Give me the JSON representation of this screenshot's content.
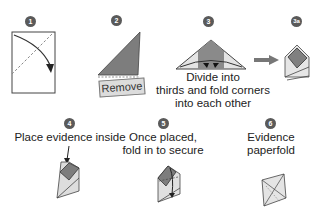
{
  "steps": [
    {
      "number": "1",
      "caption": ""
    },
    {
      "number": "2",
      "caption": "",
      "tag": "Remove"
    },
    {
      "number": "3",
      "caption_lines": [
        "Divide into",
        "thirds and fold corners",
        "into each other"
      ]
    },
    {
      "number": "3a",
      "caption": ""
    },
    {
      "number": "4",
      "caption": "Place evidence inside"
    },
    {
      "number": "5",
      "caption_lines": [
        "Once placed,",
        "fold in to secure"
      ]
    },
    {
      "number": "6",
      "caption_lines": [
        "Evidence",
        "paperfold"
      ]
    }
  ],
  "colors": {
    "step_badge": "#5a5a5a",
    "dark_fill": "#7a7a7a",
    "light_fill": "#d8d8d8",
    "outline": "#333333"
  }
}
